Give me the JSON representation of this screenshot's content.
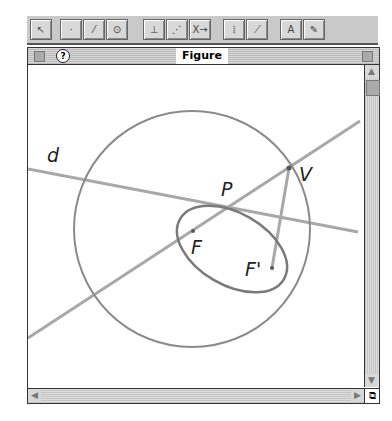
{
  "toolbar": {
    "tools": [
      {
        "name": "arrow-tool",
        "glyph": "↖"
      },
      {
        "name": "point-tool",
        "glyph": "·"
      },
      {
        "name": "line-tool",
        "glyph": "⁄"
      },
      {
        "name": "circle-tool",
        "glyph": "⊙"
      },
      {
        "name": "construct-tool",
        "glyph": "⊥"
      },
      {
        "name": "transform-tool",
        "glyph": "⋰"
      },
      {
        "name": "macro-tool",
        "glyph": "X→"
      },
      {
        "name": "measure-tool",
        "glyph": "⁞"
      },
      {
        "name": "display-tool",
        "glyph": "⟋"
      },
      {
        "name": "text-tool",
        "glyph": "A"
      },
      {
        "name": "draw-tool",
        "glyph": "✎"
      }
    ]
  },
  "window": {
    "title": "Figure",
    "help_glyph": "?"
  },
  "figure": {
    "labels": {
      "d": "d",
      "P": "P",
      "V": "V",
      "F": "F",
      "Fp": "F'"
    }
  },
  "colors": {
    "stroke": "#8a8a8a",
    "line": "#a8a8a8"
  }
}
